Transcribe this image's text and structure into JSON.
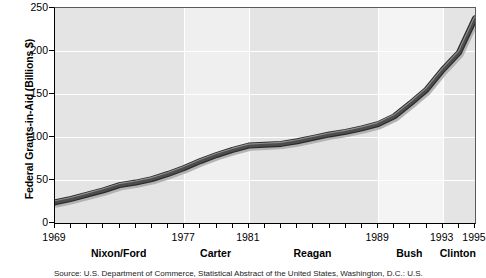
{
  "chart_data": {
    "type": "line",
    "title": "",
    "xlabel": "",
    "ylabel": "Federal Grants-in-Aid (Billions $)",
    "ylim": [
      0,
      250
    ],
    "xlim": [
      1969,
      1995
    ],
    "grid": true,
    "legend": "none",
    "y_ticks": [
      250,
      200,
      150,
      100,
      50,
      0
    ],
    "y_tick_labels": [
      "250",
      "200",
      "150",
      "100",
      "50",
      "0"
    ],
    "x_tick_labels": [
      {
        "value": 1969,
        "label": "1969"
      },
      {
        "value": 1977,
        "label": "1977"
      },
      {
        "value": 1981,
        "label": "1981"
      },
      {
        "value": 1989,
        "label": "1989"
      },
      {
        "value": 1993,
        "label": "1993"
      },
      {
        "value": 1995,
        "label": "1995"
      }
    ],
    "x_minor_ticks": [
      1969,
      1970,
      1971,
      1972,
      1973,
      1974,
      1975,
      1976,
      1977,
      1978,
      1979,
      1980,
      1981,
      1982,
      1983,
      1984,
      1985,
      1986,
      1987,
      1988,
      1989,
      1990,
      1991,
      1992,
      1993,
      1994,
      1995
    ],
    "eras": [
      {
        "name": "Nixon/Ford",
        "start": 1969,
        "end": 1977,
        "shade": "#e4e4e4"
      },
      {
        "name": "Carter",
        "start": 1977,
        "end": 1981,
        "shade": "#efefef"
      },
      {
        "name": "Reagan",
        "start": 1981,
        "end": 1989,
        "shade": "#e4e4e4"
      },
      {
        "name": "Bush",
        "start": 1989,
        "end": 1993,
        "shade": "#f4f4f4"
      },
      {
        "name": "Clinton",
        "start": 1993,
        "end": 1995,
        "shade": "#e4e4e4"
      }
    ],
    "x": [
      1969,
      1970,
      1971,
      1972,
      1973,
      1974,
      1975,
      1976,
      1977,
      1978,
      1979,
      1980,
      1981,
      1982,
      1983,
      1984,
      1985,
      1986,
      1987,
      1988,
      1989,
      1990,
      1991,
      1992,
      1993,
      1994,
      1995
    ],
    "values": [
      24,
      28,
      33,
      38,
      44,
      47,
      51,
      57,
      64,
      72,
      79,
      85,
      90,
      91,
      92,
      95,
      99,
      103,
      106,
      110,
      115,
      124,
      139,
      155,
      178,
      198,
      238
    ],
    "series": [
      {
        "name": "Federal Grants-in-Aid",
        "values": [
          24,
          28,
          33,
          38,
          44,
          47,
          51,
          57,
          64,
          72,
          79,
          85,
          90,
          91,
          92,
          95,
          99,
          103,
          106,
          110,
          115,
          124,
          139,
          155,
          178,
          198,
          238
        ],
        "color": "#4d4d4d",
        "shadow_color": "#b3b3b3",
        "line_width": 6
      }
    ],
    "source_note": "Source: U.S. Department of Commerce, Statistical Abstract of the United States, Washington, D.C.: U.S."
  }
}
